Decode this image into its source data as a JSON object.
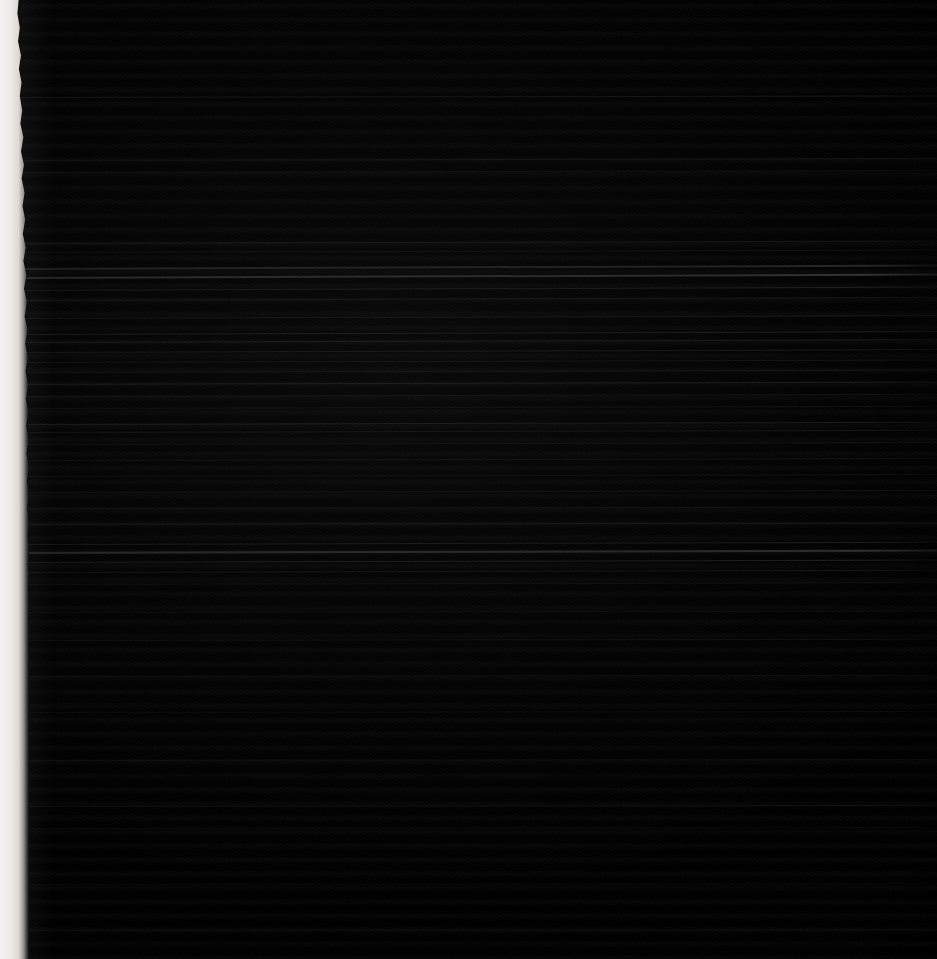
{
  "image": {
    "kind": "document-scan",
    "title": "",
    "visible_text": "",
    "legible_text_present": false,
    "description": "Severely underexposed photograph of a printed text page; no text is legible.",
    "width": 937,
    "height": 959
  },
  "appearance": {
    "background_color": "#0b0b0b",
    "paper_color": "#121212",
    "edge_strip_color": "#f2f2f0",
    "streak_color": "#6e6e6e",
    "overall_tone": "near-black"
  },
  "regions": {
    "page_edge": {
      "name": "left-page-edge",
      "side": "left",
      "width_px": 22,
      "color": "#f2f2f0",
      "texture": "ragged torn edge"
    },
    "text_block": {
      "name": "text-body",
      "left_px": 22,
      "top_px": 0,
      "right_px": 937,
      "bottom_px": 959,
      "line_spacing_px": 14,
      "readable": false
    }
  },
  "streaks": [
    {
      "top": 97,
      "height": 1,
      "opacity": 0.16,
      "angle": -0.1
    },
    {
      "top": 160,
      "height": 1,
      "opacity": 0.1,
      "angle": -0.12
    },
    {
      "top": 172,
      "height": 1,
      "opacity": 0.09,
      "angle": -0.12
    },
    {
      "top": 243,
      "height": 1,
      "opacity": 0.13,
      "angle": -0.16
    },
    {
      "top": 252,
      "height": 1,
      "opacity": 0.11,
      "angle": -0.16
    },
    {
      "top": 268,
      "height": 2,
      "opacity": 0.26,
      "angle": -0.22
    },
    {
      "top": 277,
      "height": 2,
      "opacity": 0.34,
      "angle": -0.22
    },
    {
      "top": 290,
      "height": 1,
      "opacity": 0.18,
      "angle": -0.22
    },
    {
      "top": 300,
      "height": 1,
      "opacity": 0.12,
      "angle": -0.2
    },
    {
      "top": 318,
      "height": 1,
      "opacity": 0.14,
      "angle": -0.18
    },
    {
      "top": 334,
      "height": 1,
      "opacity": 0.2,
      "angle": -0.18
    },
    {
      "top": 342,
      "height": 1,
      "opacity": 0.15,
      "angle": -0.18
    },
    {
      "top": 352,
      "height": 1,
      "opacity": 0.17,
      "angle": -0.18
    },
    {
      "top": 362,
      "height": 1,
      "opacity": 0.13,
      "angle": -0.16
    },
    {
      "top": 372,
      "height": 1,
      "opacity": 0.11,
      "angle": -0.16
    },
    {
      "top": 384,
      "height": 1,
      "opacity": 0.15,
      "angle": -0.16
    },
    {
      "top": 396,
      "height": 1,
      "opacity": 0.12,
      "angle": -0.14
    },
    {
      "top": 408,
      "height": 1,
      "opacity": 0.1,
      "angle": -0.14
    },
    {
      "top": 424,
      "height": 1,
      "opacity": 0.18,
      "angle": -0.14
    },
    {
      "top": 432,
      "height": 1,
      "opacity": 0.14,
      "angle": -0.14
    },
    {
      "top": 444,
      "height": 1,
      "opacity": 0.11,
      "angle": -0.12
    },
    {
      "top": 460,
      "height": 1,
      "opacity": 0.12,
      "angle": -0.12
    },
    {
      "top": 476,
      "height": 1,
      "opacity": 0.1,
      "angle": -0.12
    },
    {
      "top": 492,
      "height": 1,
      "opacity": 0.13,
      "angle": -0.12
    },
    {
      "top": 508,
      "height": 1,
      "opacity": 0.11,
      "angle": -0.1
    },
    {
      "top": 524,
      "height": 1,
      "opacity": 0.14,
      "angle": -0.1
    },
    {
      "top": 544,
      "height": 1,
      "opacity": 0.19,
      "angle": -0.14
    },
    {
      "top": 552,
      "height": 2,
      "opacity": 0.3,
      "angle": -0.16
    },
    {
      "top": 562,
      "height": 1,
      "opacity": 0.22,
      "angle": -0.16
    },
    {
      "top": 572,
      "height": 1,
      "opacity": 0.15,
      "angle": -0.14
    },
    {
      "top": 584,
      "height": 1,
      "opacity": 0.1,
      "angle": -0.12
    },
    {
      "top": 612,
      "height": 1,
      "opacity": 0.09,
      "angle": -0.1
    },
    {
      "top": 640,
      "height": 1,
      "opacity": 0.1,
      "angle": -0.08
    },
    {
      "top": 676,
      "height": 1,
      "opacity": 0.08,
      "angle": -0.08
    },
    {
      "top": 712,
      "height": 1,
      "opacity": 0.08,
      "angle": -0.06
    },
    {
      "top": 760,
      "height": 1,
      "opacity": 0.09,
      "angle": -0.06
    },
    {
      "top": 806,
      "height": 1,
      "opacity": 0.11,
      "angle": -0.06
    },
    {
      "top": 828,
      "height": 1,
      "opacity": 0.08,
      "angle": -0.06
    },
    {
      "top": 884,
      "height": 1,
      "opacity": 0.07,
      "angle": -0.04
    },
    {
      "top": 930,
      "height": 1,
      "opacity": 0.07,
      "angle": -0.04
    }
  ]
}
